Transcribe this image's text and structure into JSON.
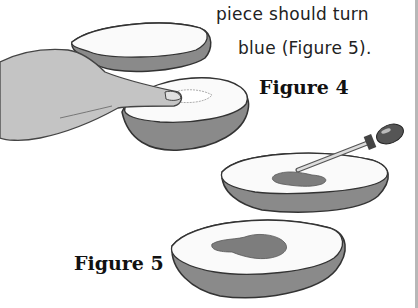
{
  "text": {
    "line1": "piece should turn",
    "line2": "blue (Figure 5)."
  },
  "figures": [
    {
      "label": "Figure 4",
      "description": "Hand pressing a finger onto the cut face of a potato half, next to another potato half"
    },
    {
      "label": "Figure 5",
      "description": "Dropper placing iodine on a potato half; second potato half showing dark blue stain"
    }
  ],
  "colors": {
    "skin": "#8a8a8a",
    "outline": "#333333",
    "stain": "#7d7d7d",
    "hand": "#c4c4c4"
  }
}
